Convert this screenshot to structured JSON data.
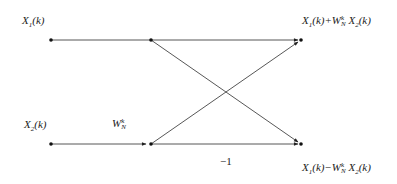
{
  "diagram": {
    "type": "butterfly",
    "title": "",
    "inputs": [
      {
        "id": "x1",
        "base": "X",
        "sub": "1",
        "arg": "(k)"
      },
      {
        "id": "x2",
        "base": "X",
        "sub": "2",
        "arg": "(k)"
      }
    ],
    "twiddle": {
      "base": "W",
      "sup": "k",
      "sub": "N"
    },
    "negation_label": "−1",
    "outputs": [
      {
        "id": "sum",
        "text_a": "X",
        "sub_a": "1",
        "arg_a": "(k)+W",
        "sup_w": "k",
        "sub_w": "N",
        "text_b": "X",
        "sub_b": "2",
        "arg_b": "(k)"
      },
      {
        "id": "diff",
        "text_a": "X",
        "sub_a": "1",
        "arg_a": "(k)−W",
        "sup_w": "k",
        "sub_w": "N",
        "text_b": "X",
        "sub_b": "2",
        "arg_b": "(k)"
      }
    ],
    "nodes": [
      {
        "id": "in1",
        "x": 51,
        "y": 40
      },
      {
        "id": "mid1",
        "x": 151,
        "y": 40
      },
      {
        "id": "in2",
        "x": 51,
        "y": 144
      },
      {
        "id": "mid2",
        "x": 151,
        "y": 144
      },
      {
        "id": "out1",
        "x": 301,
        "y": 40
      },
      {
        "id": "out2",
        "x": 301,
        "y": 144
      }
    ],
    "edges": [
      {
        "from": "in1",
        "to": "mid1",
        "arrow": false
      },
      {
        "from": "in2",
        "to": "mid2",
        "arrow": true
      },
      {
        "from": "mid1",
        "to": "out1",
        "arrow": true
      },
      {
        "from": "mid1",
        "to": "out2",
        "arrow": true
      },
      {
        "from": "mid2",
        "to": "out1",
        "arrow": true
      },
      {
        "from": "mid2",
        "to": "out2",
        "arrow": true
      }
    ],
    "colors": {
      "line": "#333333",
      "node": "#111111"
    }
  }
}
